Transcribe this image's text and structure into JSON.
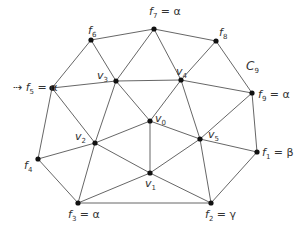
{
  "diagram": {
    "type": "triangulated-polygon",
    "region_label": {
      "text": "C",
      "sub": "9",
      "x": 246,
      "y": 60
    },
    "nodes": [
      {
        "id": "f1",
        "x": 257,
        "y": 152,
        "label": "f",
        "sub": "1",
        "value": "= β",
        "lx": 262,
        "ly": 147
      },
      {
        "id": "f2",
        "x": 211,
        "y": 203,
        "label": "f",
        "sub": "2",
        "value": "= γ",
        "lx": 205,
        "ly": 209
      },
      {
        "id": "f3",
        "x": 78,
        "y": 203,
        "label": "f",
        "sub": "3",
        "value": "= α",
        "lx": 68,
        "ly": 209
      },
      {
        "id": "f4",
        "x": 38,
        "y": 159,
        "label": "f",
        "sub": "4",
        "value": "",
        "lx": 24,
        "ly": 160
      },
      {
        "id": "f5",
        "x": 52,
        "y": 88,
        "label": "f",
        "sub": "5",
        "value": "= α",
        "lx": 13,
        "ly": 82
      },
      {
        "id": "f6",
        "x": 91,
        "y": 40,
        "label": "f",
        "sub": "6",
        "value": "",
        "lx": 88,
        "ly": 25
      },
      {
        "id": "f7",
        "x": 154,
        "y": 29,
        "label": "f",
        "sub": "7",
        "value": "= α",
        "lx": 149,
        "ly": 6
      },
      {
        "id": "f8",
        "x": 216,
        "y": 41,
        "label": "f",
        "sub": "8",
        "value": "",
        "lx": 219,
        "ly": 27
      },
      {
        "id": "f9",
        "x": 252,
        "y": 93,
        "label": "f",
        "sub": "9",
        "value": "= α",
        "lx": 258,
        "ly": 89
      },
      {
        "id": "v0",
        "x": 150,
        "y": 121,
        "label": "v",
        "sub": "0",
        "value": "",
        "lx": 155,
        "ly": 113
      },
      {
        "id": "v1",
        "x": 150,
        "y": 173,
        "label": "v",
        "sub": "1",
        "value": "",
        "lx": 145,
        "ly": 178
      },
      {
        "id": "v2",
        "x": 95,
        "y": 143,
        "label": "v",
        "sub": "2",
        "value": "",
        "lx": 75,
        "ly": 131
      },
      {
        "id": "v3",
        "x": 116,
        "y": 81,
        "label": "v",
        "sub": "3",
        "value": "",
        "lx": 97,
        "ly": 70
      },
      {
        "id": "v4",
        "x": 181,
        "y": 80,
        "label": "v",
        "sub": "4",
        "value": "",
        "lx": 176,
        "ly": 66
      },
      {
        "id": "v5",
        "x": 200,
        "y": 139,
        "label": "v",
        "sub": "5",
        "value": "",
        "lx": 208,
        "ly": 129
      }
    ],
    "edges": [
      [
        "f7",
        "f8"
      ],
      [
        "f8",
        "f9"
      ],
      [
        "f9",
        "f1"
      ],
      [
        "f1",
        "f2"
      ],
      [
        "f2",
        "f3"
      ],
      [
        "f3",
        "f4"
      ],
      [
        "f4",
        "f5"
      ],
      [
        "f5",
        "f6"
      ],
      [
        "f6",
        "f7"
      ],
      [
        "f6",
        "v3"
      ],
      [
        "f7",
        "v3"
      ],
      [
        "f7",
        "v4"
      ],
      [
        "f8",
        "v4"
      ],
      [
        "f5",
        "v3"
      ],
      [
        "v3",
        "v4"
      ],
      [
        "v4",
        "f9"
      ],
      [
        "f5",
        "v2"
      ],
      [
        "f4",
        "v2"
      ],
      [
        "f3",
        "v2"
      ],
      [
        "v3",
        "v2"
      ],
      [
        "v3",
        "v0"
      ],
      [
        "v4",
        "v0"
      ],
      [
        "v4",
        "v5"
      ],
      [
        "f9",
        "v5"
      ],
      [
        "f1",
        "v5"
      ],
      [
        "f2",
        "v5"
      ],
      [
        "v2",
        "v0"
      ],
      [
        "v0",
        "v5"
      ],
      [
        "v0",
        "v1"
      ],
      [
        "v2",
        "v1"
      ],
      [
        "v1",
        "v5"
      ],
      [
        "f3",
        "v1"
      ],
      [
        "v1",
        "f2"
      ]
    ]
  }
}
